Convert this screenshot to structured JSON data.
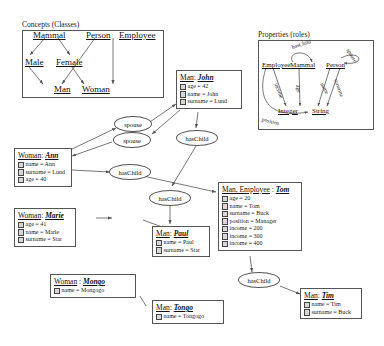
{
  "diagram": {
    "frames": {
      "concepts": {
        "title": "Concepts (Classes)"
      },
      "properties": {
        "title": "Properties (roles)"
      }
    },
    "concept_classes": [
      {
        "id": "mammal",
        "label": "Mammal"
      },
      {
        "id": "person",
        "label": "Person"
      },
      {
        "id": "employee",
        "label": "Employee"
      },
      {
        "id": "male",
        "label": "Male"
      },
      {
        "id": "female",
        "label": "Female"
      },
      {
        "id": "man",
        "label": "Man"
      },
      {
        "id": "woman",
        "label": "Woman"
      }
    ],
    "concept_edges": [
      {
        "from": "Mammal",
        "to": "Male"
      },
      {
        "from": "Mammal",
        "to": "Female"
      },
      {
        "from": "Male",
        "to": "Man"
      },
      {
        "from": "Female",
        "to": "Woman"
      },
      {
        "from": "Person",
        "to": "Man"
      },
      {
        "from": "Person",
        "to": "Woman"
      }
    ],
    "property_nodes": [
      {
        "id": "employee",
        "label": "Employee"
      },
      {
        "id": "mammal",
        "label": "Mammal"
      },
      {
        "id": "person",
        "label": "Person"
      },
      {
        "id": "integer",
        "label": "Integer"
      },
      {
        "id": "string",
        "label": "String"
      }
    ],
    "property_edges": [
      {
        "label": "hasChild",
        "from": "Mammal",
        "to": "Mammal"
      },
      {
        "label": "income",
        "from": "Employee",
        "to": "Integer"
      },
      {
        "label": "age",
        "from": "Mammal",
        "to": "Integer"
      },
      {
        "label": "name",
        "from": "Person",
        "to": "String"
      },
      {
        "label": "surname",
        "from": "Person",
        "to": "String"
      },
      {
        "label": "spouse",
        "from": "Person",
        "to": "Person"
      },
      {
        "label": "position",
        "from": "Employee",
        "to": "String"
      }
    ],
    "instances": [
      {
        "id": "john",
        "type": "Man",
        "name": "John",
        "attributes": [
          "age = 42",
          "name = John",
          "surname = Lund"
        ]
      },
      {
        "id": "ann",
        "type": "Woman",
        "name": "Ann",
        "attributes": [
          "name = Ann",
          "surname = Lund",
          "age = 40"
        ]
      },
      {
        "id": "marie",
        "type": "Woman",
        "name": "Marie",
        "attributes": [
          "age = 41",
          "name = Marie",
          "surname = Star"
        ]
      },
      {
        "id": "tom",
        "type": "Man, Employee",
        "name": "Tom",
        "attributes": [
          "age = 20",
          "name = Tom",
          "surname = Buck",
          "position = Manager",
          "income = 200",
          "income = 300",
          "income = 400"
        ]
      },
      {
        "id": "paul",
        "type": "Man",
        "name": "Paul",
        "attributes": [
          "name = Paul",
          "surname = Star"
        ]
      },
      {
        "id": "mongo",
        "type": "Woman",
        "name": "Mongo",
        "attributes": [
          "name = Mongogo"
        ]
      },
      {
        "id": "tongo",
        "type": "Man",
        "name": "Tongo",
        "attributes": [
          "name = Tongogo"
        ]
      },
      {
        "id": "tim",
        "type": "Man",
        "name": "Tim",
        "attributes": [
          "name = Tim",
          "surname = Buck"
        ]
      }
    ],
    "relations": [
      {
        "id": "spouse-1",
        "label": "spouse"
      },
      {
        "id": "spouse-2",
        "label": "spouse"
      },
      {
        "id": "haschild-1",
        "label": "hasChild"
      },
      {
        "id": "haschild-2",
        "label": "hasChild"
      },
      {
        "id": "haschild-3",
        "label": "hasChild"
      },
      {
        "id": "haschild-4",
        "label": "hasChild"
      }
    ],
    "colors": {
      "stroke": "#555555",
      "text": "#111111",
      "background": "#ffffff",
      "bullet": "#d8d8d8"
    }
  }
}
